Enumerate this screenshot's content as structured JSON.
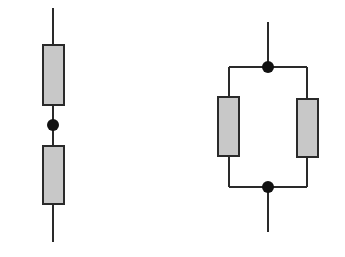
{
  "diagram": {
    "type": "circuit-schematic",
    "colors": {
      "background": "#ffffff",
      "wire": "#2a2a2a",
      "resistor_fill": "#c8c8c8",
      "resistor_stroke": "#2a2a2a",
      "junction": "#111111"
    },
    "circuits": [
      {
        "id": "series",
        "configuration": "series",
        "resistor_count": 2,
        "junction_count": 1,
        "wires": [
          {
            "x1": 53,
            "y1": 8,
            "x2": 53,
            "y2": 45
          },
          {
            "x1": 53,
            "y1": 105,
            "x2": 53,
            "y2": 146
          },
          {
            "x1": 53,
            "y1": 204,
            "x2": 53,
            "y2": 242
          }
        ],
        "resistors": [
          {
            "x": 43,
            "y": 45,
            "w": 21,
            "h": 60
          },
          {
            "x": 43,
            "y": 146,
            "w": 21,
            "h": 58
          }
        ],
        "junctions": [
          {
            "cx": 53,
            "cy": 125,
            "r": 6
          }
        ]
      },
      {
        "id": "parallel",
        "configuration": "parallel",
        "resistor_count": 2,
        "junction_count": 2,
        "wires": [
          {
            "x1": 268,
            "y1": 22,
            "x2": 268,
            "y2": 67
          },
          {
            "x1": 229,
            "y1": 67,
            "x2": 307,
            "y2": 67
          },
          {
            "x1": 229,
            "y1": 67,
            "x2": 229,
            "y2": 97
          },
          {
            "x1": 307,
            "y1": 67,
            "x2": 307,
            "y2": 99
          },
          {
            "x1": 229,
            "y1": 156,
            "x2": 229,
            "y2": 187
          },
          {
            "x1": 307,
            "y1": 157,
            "x2": 307,
            "y2": 187
          },
          {
            "x1": 229,
            "y1": 187,
            "x2": 307,
            "y2": 187
          },
          {
            "x1": 268,
            "y1": 187,
            "x2": 268,
            "y2": 232
          }
        ],
        "resistors": [
          {
            "x": 218,
            "y": 97,
            "w": 21,
            "h": 59
          },
          {
            "x": 297,
            "y": 99,
            "w": 21,
            "h": 58
          }
        ],
        "junctions": [
          {
            "cx": 268,
            "cy": 67,
            "r": 6
          },
          {
            "cx": 268,
            "cy": 187,
            "r": 6
          }
        ]
      }
    ]
  }
}
